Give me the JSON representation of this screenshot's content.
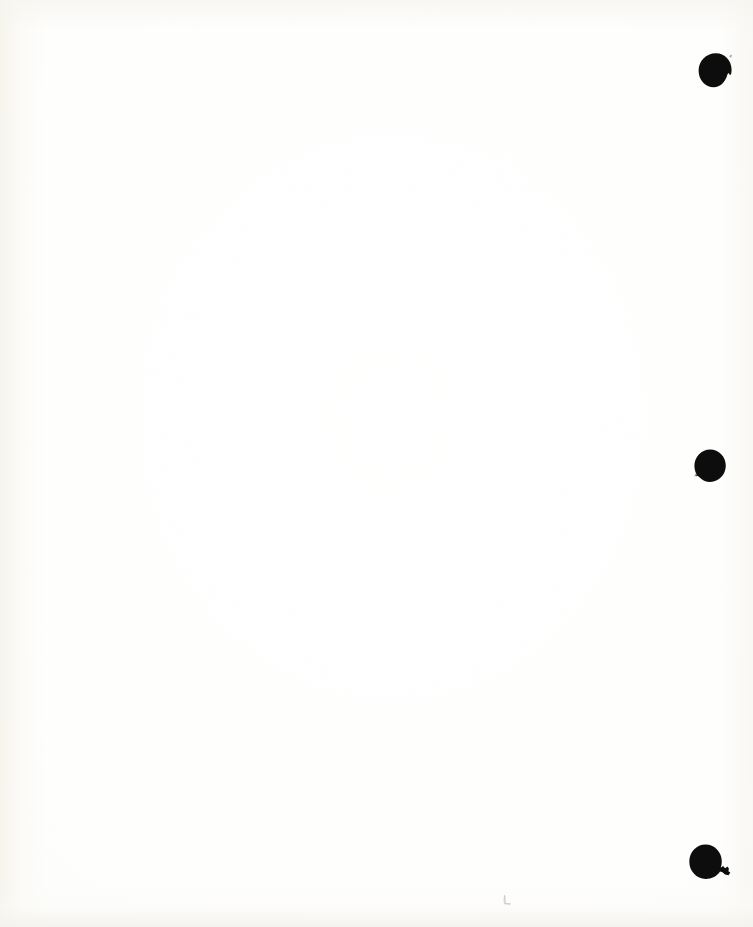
{
  "document": {
    "kind": "scanned-page",
    "title": "Scanned blank page",
    "page_width": 753,
    "page_height": 927,
    "content_text": "",
    "note": "Blank white paper; no printed text, headings, figures or captions are visible."
  },
  "colors": {
    "paper": "#fdfdfc",
    "paper_warm_edge": "#f6f3ec",
    "ink_black": "#0d0d0d",
    "pencil_gray": "#8d8d92"
  },
  "marks": [
    {
      "id": "punch-hole-top",
      "name": "punch-hole-mark-top",
      "shape": "filled-circle-with-notch",
      "color": "#0d0d0d",
      "x": 698,
      "y": 53,
      "width": 36,
      "height": 37,
      "description": "Solid black round punch-hole mark with a small notch at upper right"
    },
    {
      "id": "punch-hole-middle",
      "name": "punch-hole-mark-middle",
      "shape": "filled-circle-with-notch",
      "color": "#0d0d0d",
      "x": 693,
      "y": 449,
      "width": 35,
      "height": 35,
      "description": "Solid black round punch-hole mark with a small notch at lower left"
    },
    {
      "id": "punch-hole-bottom",
      "name": "punch-hole-mark-bottom",
      "shape": "filled-circle-with-tail",
      "color": "#0d0d0d",
      "x": 689,
      "y": 844,
      "width": 42,
      "height": 37,
      "description": "Solid black round punch-hole mark with a wedge-shaped tail extending to the right"
    },
    {
      "id": "pencil-tick",
      "name": "pencil-tick-mark",
      "shape": "small-angle-stroke",
      "color": "#8d8d92",
      "x": 502,
      "y": 896,
      "width": 11,
      "height": 12,
      "description": "Very faint small grey pencil tick resembling a lowercase L near bottom centre"
    }
  ]
}
